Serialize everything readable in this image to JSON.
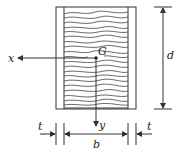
{
  "diagram": {
    "labels": {
      "centroid": "G",
      "x_axis": "x",
      "y_axis": "y",
      "depth": "d",
      "width": "b",
      "plate_thickness_left": "t",
      "plate_thickness_right": "t"
    },
    "colors": {
      "line": "#333333",
      "background": "#ffffff"
    }
  }
}
